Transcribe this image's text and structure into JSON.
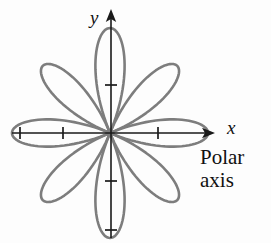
{
  "figure": {
    "background_color": "#fdfdfd",
    "width": 271,
    "height": 243
  },
  "axes": {
    "x_label": "x",
    "y_label": "y",
    "axis_color": "#1a1a1a",
    "origin": {
      "x": 110,
      "y": 133
    },
    "x_axis": {
      "start_x": 12,
      "end_x": 215,
      "y": 133
    },
    "y_axis": {
      "x": 111,
      "start_y": 9,
      "end_y": 238
    },
    "x_ticks": [
      20,
      63,
      158
    ],
    "y_ticks": [
      85,
      181,
      230
    ],
    "tick_half_length": 6
  },
  "caption": {
    "line1": "Polar",
    "line2": "axis"
  },
  "chart_data": {
    "type": "line",
    "equation": "r = a cos(4θ)",
    "curve_color": "#7d7d7d",
    "stroke_width": 2.6,
    "petal_count": 8,
    "petal_angles_deg": [
      0,
      45,
      90,
      135,
      180,
      225,
      270,
      315
    ],
    "petal_radii_px": {
      "horizontal": 98,
      "vertical": 105,
      "diagonal": 95
    },
    "center_px": {
      "x": 110,
      "y": 133
    },
    "xlabel": "x",
    "ylabel": "y",
    "grid": false,
    "legend": "none"
  }
}
